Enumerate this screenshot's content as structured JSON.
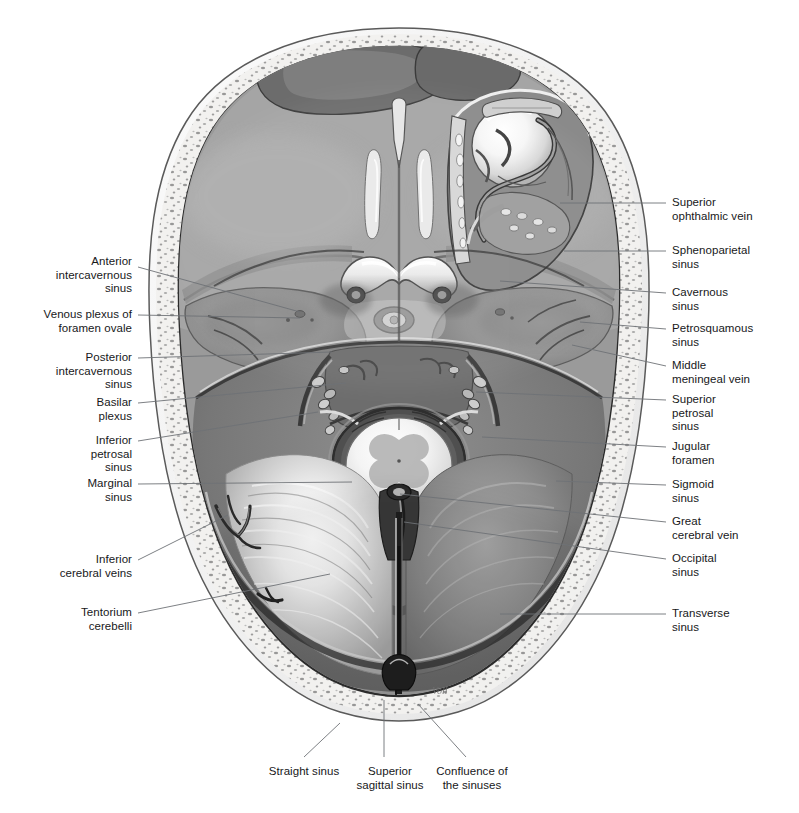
{
  "figure": {
    "signature": "Voll",
    "bg_color": "#ffffff",
    "text_color": "#17181a",
    "leader_color": "#6e7276"
  },
  "labels": {
    "left": [
      {
        "id": "anterior-intercavernous-sinus",
        "text": "Anterior\nintercavernous\nsinus",
        "x": 132,
        "y": 255,
        "align": "right",
        "leader": [
          [
            138,
            267
          ],
          [
            300,
            312
          ]
        ]
      },
      {
        "id": "venous-plexus-foramen-ovale",
        "text": "Venous plexus of\nforamen ovale",
        "x": 132,
        "y": 308,
        "align": "right",
        "leader": [
          [
            138,
            315
          ],
          [
            300,
            318
          ]
        ]
      },
      {
        "id": "posterior-intercavernous-sinus",
        "text": "Posterior\nintercavernous\nsinus",
        "x": 132,
        "y": 351,
        "align": "right",
        "leader": [
          [
            138,
            358
          ],
          [
            332,
            352
          ]
        ]
      },
      {
        "id": "basilar-plexus",
        "text": "Basilar\nplexus",
        "x": 132,
        "y": 396,
        "align": "right",
        "leader": [
          [
            138,
            403
          ],
          [
            346,
            383
          ]
        ]
      },
      {
        "id": "inferior-petrosal-sinus",
        "text": "Inferior\npetrosal\nsinus",
        "x": 132,
        "y": 434,
        "align": "right",
        "leader": [
          [
            138,
            441
          ],
          [
            318,
            412
          ]
        ]
      },
      {
        "id": "marginal-sinus",
        "text": "Marginal\nsinus",
        "x": 132,
        "y": 477,
        "align": "right",
        "leader": [
          [
            138,
            484
          ],
          [
            352,
            482
          ]
        ]
      },
      {
        "id": "inferior-cerebral-veins",
        "text": "Inferior\ncerebral veins",
        "x": 132,
        "y": 553,
        "align": "right",
        "leader": [
          [
            138,
            560
          ],
          [
            228,
            515
          ]
        ]
      },
      {
        "id": "tentorium-cerebelli",
        "text": "Tentorium\ncerebelli",
        "x": 132,
        "y": 606,
        "align": "right",
        "leader": [
          [
            138,
            613
          ],
          [
            330,
            574
          ]
        ]
      }
    ],
    "right": [
      {
        "id": "superior-ophthalmic-vein",
        "text": "Superior\nophthalmic vein",
        "x": 672,
        "y": 196,
        "align": "left",
        "leader": [
          [
            666,
            203
          ],
          [
            560,
            203
          ]
        ]
      },
      {
        "id": "sphenoparietal-sinus",
        "text": "Sphenoparietal\nsinus",
        "x": 672,
        "y": 244,
        "align": "left",
        "leader": [
          [
            666,
            251
          ],
          [
            564,
            251
          ]
        ]
      },
      {
        "id": "cavernous-sinus",
        "text": "Cavernous\nsinus",
        "x": 672,
        "y": 286,
        "align": "left",
        "leader": [
          [
            666,
            293
          ],
          [
            500,
            281
          ]
        ]
      },
      {
        "id": "petrosquamous-sinus",
        "text": "Petrosquamous\nsinus",
        "x": 672,
        "y": 322,
        "align": "left",
        "leader": [
          [
            666,
            329
          ],
          [
            580,
            322
          ]
        ]
      },
      {
        "id": "middle-meningeal-vein",
        "text": "Middle\nmeningeal vein",
        "x": 672,
        "y": 359,
        "align": "left",
        "leader": [
          [
            666,
            366
          ],
          [
            572,
            345
          ]
        ]
      },
      {
        "id": "superior-petrosal-sinus",
        "text": "Superior\npetrosal\nsinus",
        "x": 672,
        "y": 393,
        "align": "left",
        "leader": [
          [
            666,
            400
          ],
          [
            476,
            392
          ]
        ]
      },
      {
        "id": "jugular-foramen",
        "text": "Jugular\nforamen",
        "x": 672,
        "y": 440,
        "align": "left",
        "leader": [
          [
            666,
            447
          ],
          [
            482,
            437
          ]
        ]
      },
      {
        "id": "sigmoid-sinus",
        "text": "Sigmoid\nsinus",
        "x": 672,
        "y": 478,
        "align": "left",
        "leader": [
          [
            666,
            485
          ],
          [
            556,
            481
          ]
        ]
      },
      {
        "id": "great-cerebral-vein",
        "text": "Great\ncerebral vein",
        "x": 672,
        "y": 515,
        "align": "left",
        "leader": [
          [
            666,
            522
          ],
          [
            400,
            494
          ]
        ]
      },
      {
        "id": "occipital-sinus",
        "text": "Occipital\nsinus",
        "x": 672,
        "y": 552,
        "align": "left",
        "leader": [
          [
            666,
            559
          ],
          [
            404,
            522
          ]
        ]
      },
      {
        "id": "transverse-sinus",
        "text": "Transverse\nsinus",
        "x": 672,
        "y": 607,
        "align": "left",
        "leader": [
          [
            666,
            614
          ],
          [
            500,
            614
          ]
        ]
      }
    ],
    "bottom": [
      {
        "id": "straight-sinus",
        "text": "Straight sinus",
        "x": 304,
        "y": 765,
        "align": "center",
        "leader": [
          [
            304,
            757
          ],
          [
            340,
            723
          ]
        ]
      },
      {
        "id": "superior-sagittal-sinus",
        "text": "Superior\nsagittal sinus",
        "x": 390,
        "y": 765,
        "align": "center",
        "leader": [
          [
            384,
            757
          ],
          [
            384,
            700
          ]
        ]
      },
      {
        "id": "confluence-of-the-sinuses",
        "text": "Confluence of\nthe sinuses",
        "x": 472,
        "y": 765,
        "align": "center",
        "leader": [
          [
            466,
            757
          ],
          [
            418,
            704
          ]
        ]
      }
    ]
  }
}
